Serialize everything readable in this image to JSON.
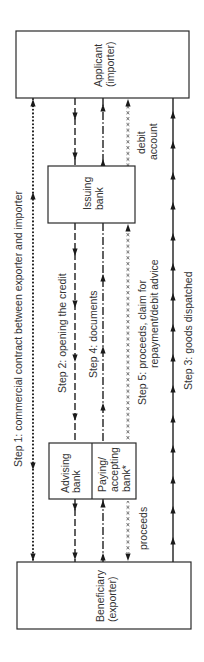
{
  "diagram": {
    "nodes": {
      "applicant": {
        "line1": "Applicant",
        "line2": "(importer)"
      },
      "issuing_bank": {
        "line1": "Issuing",
        "line2": "bank"
      },
      "advising_bank": {
        "line1": "Advising",
        "line2": "bank"
      },
      "paying_bank": {
        "line1": "Paying/",
        "line2": "accepting",
        "line3": "bank*"
      },
      "beneficiary": {
        "line1": "Beneficiary",
        "line2": "(exporter)"
      }
    },
    "steps": [
      {
        "id": 1,
        "label": "Step 1: commercial contract between exporter and importer",
        "style": "dotted",
        "path": [
          "beneficiary",
          "applicant"
        ],
        "direction": "both"
      },
      {
        "id": 2,
        "label": "Step 2: opening the credit",
        "style": "dashed",
        "path": [
          "applicant",
          "issuing_bank",
          "advising_bank",
          "beneficiary"
        ],
        "direction": "down"
      },
      {
        "id": 3,
        "label": "Step 3: goods dispatched",
        "style": "solid",
        "path": [
          "beneficiary",
          "applicant"
        ],
        "direction": "up"
      },
      {
        "id": 4,
        "label": "Step 4: documents",
        "style": "dash-dot",
        "path": [
          "beneficiary",
          "paying_bank",
          "issuing_bank",
          "applicant"
        ],
        "direction": "up"
      },
      {
        "id": 5,
        "label_line1": "Step 5: proceeds, claim for",
        "label_line2": "repayment/debit advice",
        "style": "x-marked",
        "segments": [
          {
            "from": "paying_bank",
            "to": "beneficiary",
            "note": "proceeds"
          },
          {
            "from": "paying_bank",
            "to": "issuing_bank",
            "note": "claim for repayment"
          },
          {
            "from": "issuing_bank",
            "to": "applicant",
            "note": "debit account"
          }
        ]
      }
    ],
    "annotations": {
      "debit_line1": "debit",
      "debit_line2": "account",
      "proceeds": "proceeds"
    }
  }
}
